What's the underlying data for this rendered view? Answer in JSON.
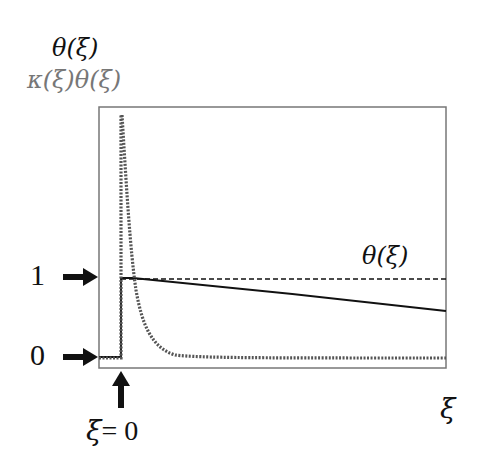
{
  "diagram": {
    "y_axis_labels": {
      "primary": "θ(ξ)",
      "secondary": "κ(ξ)θ(ξ)"
    },
    "level_markers": [
      {
        "label": "1",
        "arrow": "right-arrow"
      },
      {
        "label": "0",
        "arrow": "right-arrow"
      }
    ],
    "curve_label": "θ(ξ)",
    "x_axis_label": "ξ",
    "origin_marker": {
      "var": "ξ",
      "eq": "= 0",
      "arrow": "up-arrow"
    },
    "colors": {
      "primary_text": "#111111",
      "secondary_text": "#777777",
      "frame": "#777777",
      "solid_curve": "#111111",
      "dotted_curve": "#555555"
    },
    "curves": [
      {
        "name": "theta",
        "style": "solid",
        "description": "step from 0 to 1 at ξ=0, then slowly decaying"
      },
      {
        "name": "theta-reference",
        "style": "dashed",
        "description": "constant level 1 for ξ>0"
      },
      {
        "name": "kappa-theta",
        "style": "dotted",
        "description": "sharp spike at ξ=0 decaying rapidly to 0"
      }
    ]
  }
}
